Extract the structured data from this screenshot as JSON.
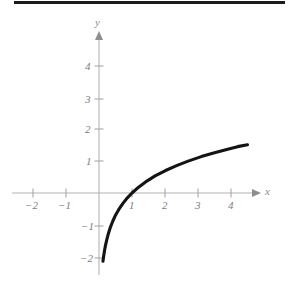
{
  "figure": {
    "kind": "cartesian-graph",
    "curve_color": "#141414",
    "axis_color": "#b2b2b2",
    "label_color": "#7d7d7d",
    "background_color": "#ffffff",
    "artifact_color": "#1a1a1a"
  },
  "axes": {
    "x_label": "x",
    "y_label": "y",
    "x_ticks": [
      {
        "label": "−2",
        "value": -2
      },
      {
        "label": "−1",
        "value": -1
      },
      {
        "label": "1",
        "value": 1
      },
      {
        "label": "2",
        "value": 2
      },
      {
        "label": "3",
        "value": 3
      },
      {
        "label": "4",
        "value": 4
      }
    ],
    "y_ticks": [
      {
        "label": "4",
        "value": 4
      },
      {
        "label": "3",
        "value": 3
      },
      {
        "label": "2",
        "value": 2
      },
      {
        "label": "1",
        "value": 1
      },
      {
        "label": "−1",
        "value": -1
      },
      {
        "label": "−2",
        "value": -2
      }
    ]
  },
  "chart_data": {
    "type": "line",
    "title": "",
    "subtitle": "",
    "xlabel": "x",
    "ylabel": "y",
    "xlim": [
      -2.7,
      5.1
    ],
    "ylim": [
      -2.6,
      4.9
    ],
    "grid": false,
    "legend": null,
    "annotations": [],
    "xticks": [
      -2,
      -1,
      1,
      2,
      3,
      4
    ],
    "yticks": [
      -2,
      -1,
      1,
      2,
      3,
      4
    ],
    "series": [
      {
        "name": "y = ln(x)",
        "color": "#141414",
        "x": [
          0.12,
          0.14,
          0.17,
          0.2,
          0.24,
          0.29,
          0.35,
          0.42,
          0.5,
          0.6,
          0.72,
          0.86,
          1.0,
          1.2,
          1.45,
          1.7,
          2.0,
          2.35,
          2.7,
          3.1,
          3.5,
          3.9,
          4.2,
          4.5
        ],
        "y": [
          -2.12,
          -1.97,
          -1.77,
          -1.61,
          -1.43,
          -1.24,
          -1.05,
          -0.87,
          -0.69,
          -0.51,
          -0.33,
          -0.15,
          0.0,
          0.18,
          0.37,
          0.53,
          0.69,
          0.85,
          0.99,
          1.13,
          1.25,
          1.36,
          1.44,
          1.5
        ]
      }
    ]
  },
  "scan_artifact": {
    "name": "top-edge-scan-bar"
  }
}
